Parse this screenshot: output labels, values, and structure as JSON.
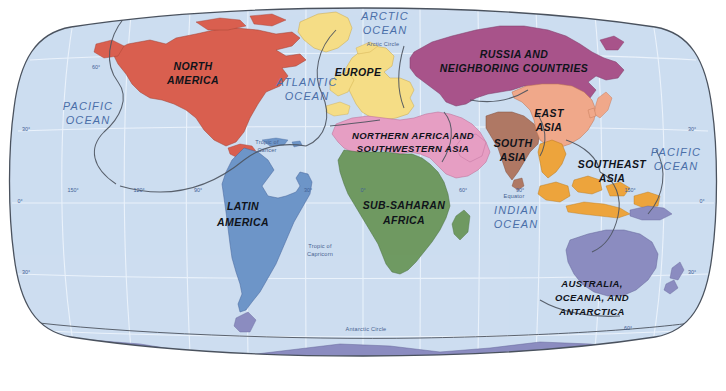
{
  "map": {
    "title": "World Regions Map",
    "projection": "Robinson",
    "background_color": "#ffffff",
    "ocean_color": "#cdddf0",
    "graticule_color": "#eef4fb",
    "border_color": "#5b6472",
    "region_boundary_color": "#4c535e",
    "label_color": "#10131a",
    "ocean_label_color": "#4a6ea8",
    "regions": [
      {
        "id": "north-america",
        "label": "NORTH\nAMERICA",
        "lines": [
          "NORTH",
          "AMERICA"
        ],
        "color": "#d9604f",
        "label_x": 193,
        "label_y": 72
      },
      {
        "id": "latin-america",
        "label": "LATIN\nAMERICA",
        "lines": [
          "LATIN",
          "AMERICA"
        ],
        "color": "#6d95c8",
        "label_x": 243,
        "label_y": 212
      },
      {
        "id": "europe",
        "label": "EUROPE",
        "lines": [
          "EUROPE"
        ],
        "color": "#f6dd87",
        "label_x": 358,
        "label_y": 74
      },
      {
        "id": "russia-and-neighbors",
        "label": "RUSSIA AND\nNEIGHBORING COUNTRIES",
        "lines": [
          "RUSSIA AND",
          "NEIGHBORING COUNTRIES"
        ],
        "color": "#a8548a",
        "label_x": 514,
        "label_y": 59
      },
      {
        "id": "northern-africa-southwestern-asia",
        "label": "NORTHERN AFRICA AND\nSOUTHWESTERN ASIA",
        "lines": [
          "NORTHERN AFRICA AND",
          "SOUTHWESTERN ASIA"
        ],
        "color": "#e69ec4",
        "label_x": 413,
        "label_y": 140
      },
      {
        "id": "sub-saharan-africa",
        "label": "SUB-SAHARAN\nAFRICA",
        "lines": [
          "SUB-SAHARAN",
          "AFRICA"
        ],
        "color": "#6f9a62",
        "label_x": 404,
        "label_y": 210
      },
      {
        "id": "south-asia",
        "label": "SOUTH\nASIA",
        "lines": [
          "SOUTH",
          "ASIA"
        ],
        "color": "#b07864",
        "label_x": 513,
        "label_y": 148
      },
      {
        "id": "east-asia",
        "label": "EAST\nASIA",
        "lines": [
          "EAST",
          "ASIA"
        ],
        "color": "#f0a88a",
        "label_x": 549,
        "label_y": 118
      },
      {
        "id": "southeast-asia",
        "label": "SOUTHEAST\nASIA",
        "lines": [
          "SOUTHEAST",
          "ASIA"
        ],
        "color": "#eda53c",
        "label_x": 612,
        "label_y": 170
      },
      {
        "id": "australia-oceania-antarctica",
        "label": "AUSTRALIA,\nOCEANIA, AND\nANTARCTICA",
        "lines": [
          "AUSTRALIA,",
          "OCEANIA, AND",
          "ANTARCTICA"
        ],
        "color": "#8b8cc0",
        "label_x": 592,
        "label_y": 290
      }
    ],
    "oceans": [
      {
        "id": "pacific-ocean-west",
        "lines": [
          "PACIFIC",
          "OCEAN"
        ],
        "x": 88,
        "y": 113
      },
      {
        "id": "atlantic-ocean",
        "lines": [
          "ATLANTIC",
          "OCEAN"
        ],
        "x": 307,
        "y": 88
      },
      {
        "id": "arctic-ocean",
        "lines": [
          "ARCTIC",
          "OCEAN"
        ],
        "x": 385,
        "y": 20
      },
      {
        "id": "indian-ocean",
        "lines": [
          "INDIAN",
          "OCEAN"
        ],
        "x": 516,
        "y": 216
      },
      {
        "id": "pacific-ocean-east",
        "lines": [
          "PACIFIC",
          "OCEAN"
        ],
        "x": 674,
        "y": 158
      }
    ],
    "reference_lines": [
      {
        "id": "arctic-circle",
        "label": "Arctic Circle",
        "x": 383,
        "y": 46
      },
      {
        "id": "tropic-of-cancer",
        "label": "Tropic of\nCancer",
        "lines": [
          "Tropic of",
          "Cancer"
        ],
        "x": 267,
        "y": 144
      },
      {
        "id": "tropic-of-capricorn",
        "label": "Tropic of\nCapricorn",
        "lines": [
          "Tropic of",
          "Capricorn"
        ],
        "x": 320,
        "y": 248
      },
      {
        "id": "equator",
        "label": "Equator",
        "x": 514,
        "y": 198
      },
      {
        "id": "antarctic-circle",
        "label": "Antarctic Circle",
        "x": 366,
        "y": 331
      }
    ],
    "graticule_labels": {
      "latitude_left": [
        {
          "text": "30°",
          "x": 26,
          "y": 131
        },
        {
          "text": "0°",
          "x": 20,
          "y": 203
        },
        {
          "text": "30°",
          "x": 26,
          "y": 274
        }
      ],
      "latitude_right": [
        {
          "text": "30°",
          "x": 690,
          "y": 131
        },
        {
          "text": "0°",
          "x": 700,
          "y": 203
        },
        {
          "text": "30°",
          "x": 690,
          "y": 274
        }
      ],
      "longitude": [
        {
          "text": "150°",
          "x": 73,
          "y": 192
        },
        {
          "text": "120°",
          "x": 139,
          "y": 192
        },
        {
          "text": "90°",
          "x": 198,
          "y": 192
        },
        {
          "text": "30°",
          "x": 308,
          "y": 192
        },
        {
          "text": "0°",
          "x": 363,
          "y": 192
        },
        {
          "text": "60°",
          "x": 463,
          "y": 192
        },
        {
          "text": "90°",
          "x": 520,
          "y": 192
        },
        {
          "text": "150°",
          "x": 630,
          "y": 192
        }
      ],
      "latitude_inner": [
        {
          "text": "60°",
          "x": 96,
          "y": 69
        },
        {
          "text": "60°",
          "x": 628,
          "y": 330
        }
      ]
    }
  }
}
